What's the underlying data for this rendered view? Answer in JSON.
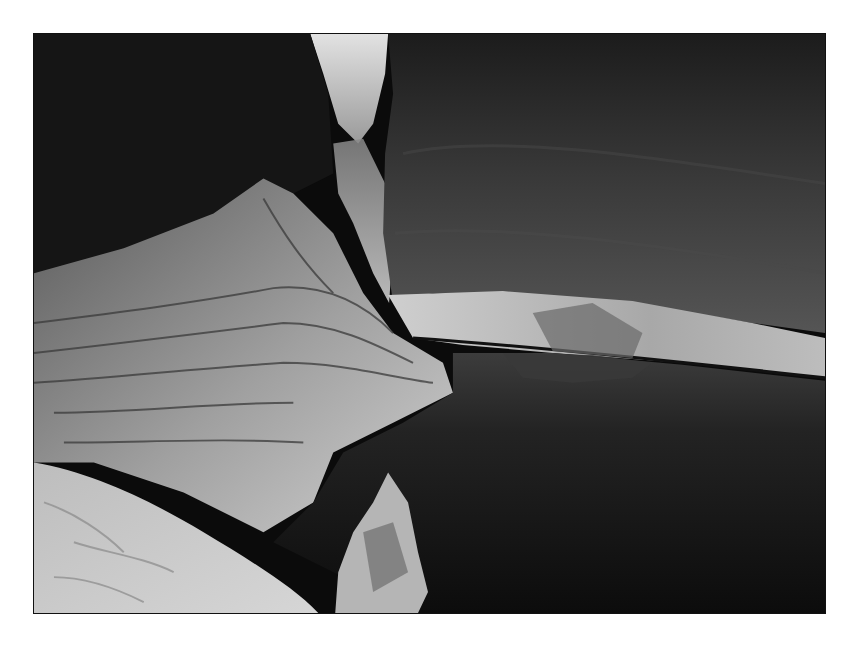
{
  "image": {
    "alt": "Black and white photograph of a narrow slot canyon with layered sandstone walls and a still pool of water reflecting the rock",
    "subject": "slot canyon with pool",
    "style": "monochrome photograph with white border",
    "colors": {
      "background": "#ffffff",
      "shadow": "#0a0a0a",
      "rock_dark": "#2a2a2a",
      "rock_mid": "#7a7a7a",
      "rock_light": "#cfcfcf",
      "sky_sliver": "#d8d8d8",
      "water": "#1a1a1a"
    }
  }
}
